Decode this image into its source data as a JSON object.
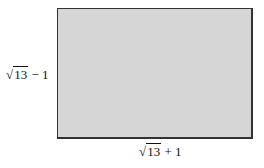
{
  "diagram": {
    "shape": "rectangle",
    "fill_color": "#d6d6d6",
    "border_color": "#333333",
    "height_label": {
      "radical": "√",
      "radicand": "13",
      "operator": "−",
      "constant": "1"
    },
    "width_label": {
      "radical": "√",
      "radicand": "13",
      "operator": "+",
      "constant": "1"
    }
  }
}
